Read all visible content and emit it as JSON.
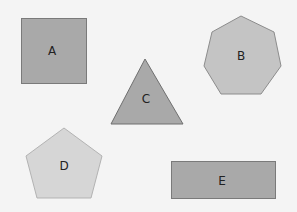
{
  "canvas": {
    "width": 297,
    "height": 212,
    "background": "#f4f4f4"
  },
  "shapes": [
    {
      "id": "A",
      "label": "A",
      "type": "square",
      "fill": "#a9a9a9",
      "stroke": "#7a7a7a"
    },
    {
      "id": "B",
      "label": "B",
      "type": "heptagon",
      "fill": "#c4c4c4",
      "stroke": "#8c8c8c"
    },
    {
      "id": "C",
      "label": "C",
      "type": "triangle",
      "fill": "#a9a9a9",
      "stroke": "#6f6f6f"
    },
    {
      "id": "D",
      "label": "D",
      "type": "pentagon",
      "fill": "#d6d6d6",
      "stroke": "#b3b3b3"
    },
    {
      "id": "E",
      "label": "E",
      "type": "rectangle",
      "fill": "#a9a9a9",
      "stroke": "#7a7a7a"
    }
  ]
}
